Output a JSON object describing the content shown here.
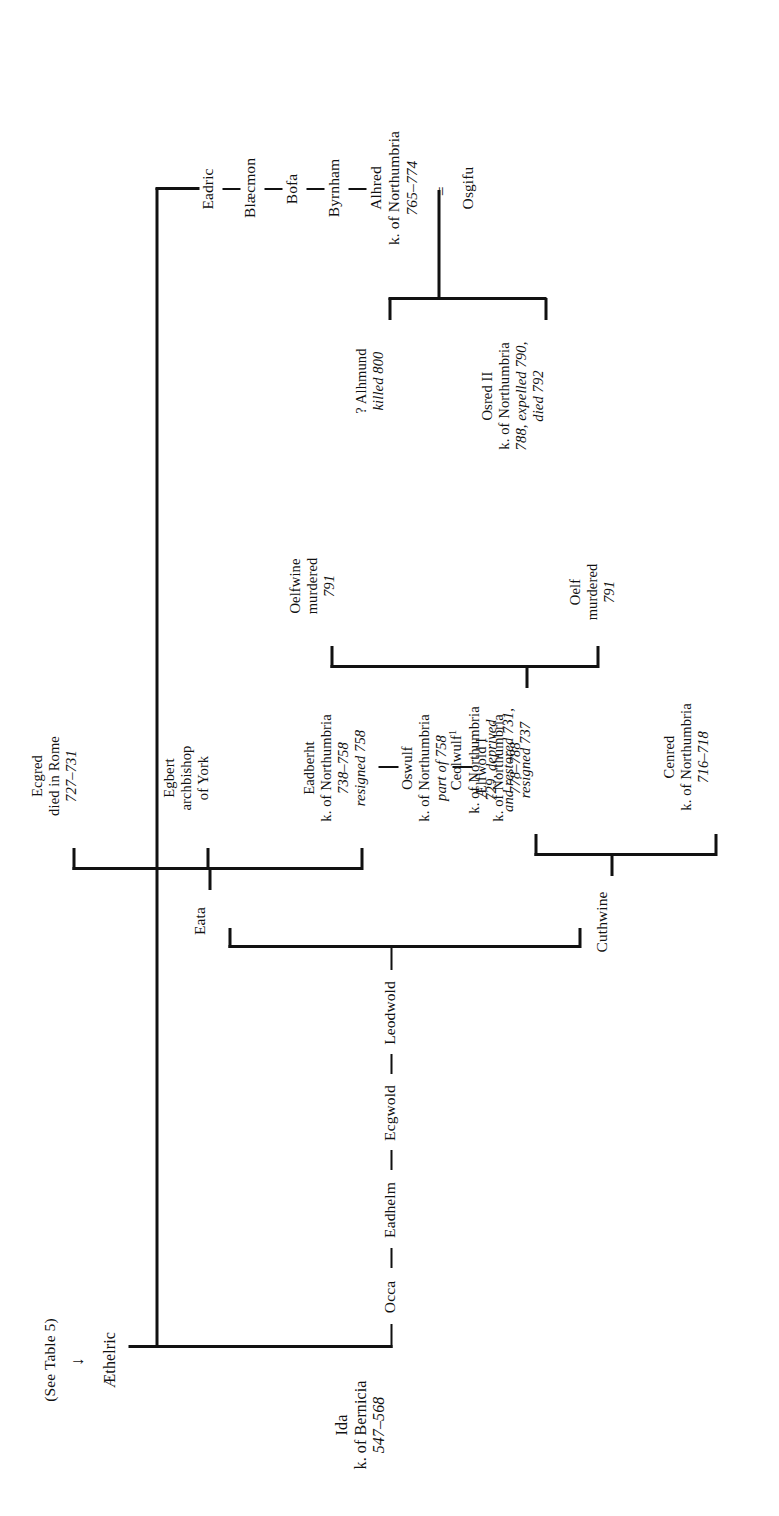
{
  "document": {
    "kind": "genealogical-table",
    "orientation": "rotated-90",
    "ink_color": "#111111",
    "paper_color": "#ffffff"
  },
  "nodes": {
    "ida": {
      "lines": [
        "Ida",
        "k. of Bernicia",
        "547–568"
      ]
    },
    "occa": {
      "lines": [
        "Occa"
      ]
    },
    "eadhelm": {
      "lines": [
        "Eadhelm"
      ]
    },
    "ecgwold": {
      "lines": [
        "Ecgwold"
      ]
    },
    "leodwold": {
      "lines": [
        "Leodwold"
      ]
    },
    "aethelric": {
      "lines": [
        "Æthelric"
      ]
    },
    "aethelric_ref": {
      "lines": [
        "(See Table 5)"
      ]
    },
    "aethelric_arrow": {
      "glyph": "↓"
    },
    "eadric": {
      "lines": [
        "Eadric"
      ]
    },
    "blaecmon": {
      "lines": [
        "Blæcmon"
      ]
    },
    "bofa": {
      "lines": [
        "Bofa"
      ]
    },
    "byrnham": {
      "lines": [
        "Byrnham"
      ]
    },
    "alhred": {
      "lines": [
        "Alhred",
        "k. of Northumbria",
        "765–774"
      ]
    },
    "osgifu": {
      "lines": [
        "Osgifu"
      ]
    },
    "marriage_sign": {
      "glyph": "="
    },
    "osred2": {
      "lines": [
        "Osred II",
        "k. of Northumbria",
        "788, expelled 790,",
        "died 792"
      ]
    },
    "alhmund": {
      "lines": [
        "? Alhmund",
        "killed 800"
      ]
    },
    "cuthwine": {
      "lines": [
        "Cuthwine"
      ]
    },
    "cenred": {
      "lines": [
        "Cenred",
        "k. of Northumbria",
        "716–718"
      ]
    },
    "ceolwulf": {
      "lines": [
        "Ceolwulf",
        "k. of Northumbria",
        "729, deprived",
        "and restored 731,",
        "resigned 737"
      ],
      "footnote": "1"
    },
    "eata": {
      "lines": [
        "Eata"
      ]
    },
    "eadberht": {
      "lines": [
        "Eadberht",
        "k. of Northumbria",
        "738–758",
        "resigned 758"
      ]
    },
    "egbert": {
      "lines": [
        "Egbert",
        "archbishop",
        "of York"
      ]
    },
    "ecgred": {
      "lines": [
        "Ecgred",
        "died in Rome",
        "727–731"
      ]
    },
    "oswulf": {
      "lines": [
        "Oswulf",
        "k. of Northumbria",
        "part of 758"
      ]
    },
    "aelfwold1": {
      "lines": [
        "Ælfwold I",
        "k. of Northumbria",
        "778–788"
      ]
    },
    "oelf": {
      "lines": [
        "Oelf",
        "murdered",
        "791"
      ]
    },
    "oelfwine": {
      "lines": [
        "Oelfwine",
        "murdered",
        "791"
      ]
    }
  }
}
